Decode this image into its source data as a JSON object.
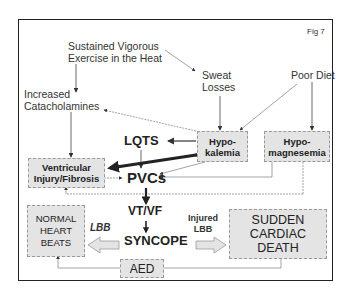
{
  "figure_label": "Fig 7",
  "nodes": {
    "exercise": [
      "Sustained Vigorous",
      "Exercise in the Heat"
    ],
    "sweat": [
      "Sweat",
      "Losses"
    ],
    "diet": "Poor Diet",
    "catecholamines": [
      "Increased",
      "Catacholamines"
    ],
    "lqts": "LQTS",
    "hypokalemia": [
      "Hypo-",
      "kalemia"
    ],
    "hypomagnesemia": [
      "Hypo-",
      "magnesemia"
    ],
    "ventricular": [
      "Ventricular",
      "Injury/Fibrosis"
    ],
    "pvcs": "PVCs",
    "vtvf": "VT/VF",
    "syncope": "SYNCOPE",
    "normal": [
      "NORMAL",
      "HEART",
      "BEATS"
    ],
    "scd": [
      "SUDDEN",
      "CARDIAC",
      "DEATH"
    ],
    "aed": "AED"
  },
  "labels": {
    "lbb": "LBB",
    "injured_lbb": [
      "Injured",
      "LBB"
    ]
  }
}
